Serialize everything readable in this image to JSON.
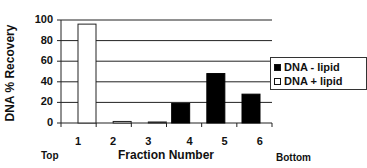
{
  "chart_data": {
    "type": "bar",
    "title": "",
    "xlabel": "Fraction Number",
    "ylabel": "DNA % Recovery",
    "ylim": [
      0,
      100
    ],
    "yticks": [
      0,
      20,
      40,
      60,
      80,
      100
    ],
    "grid": "horizontal",
    "categories": [
      "1",
      "2",
      "3",
      "4",
      "5",
      "6"
    ],
    "series": [
      {
        "name": "DNA - lipid",
        "color": "#000000",
        "values": [
          0,
          0,
          0,
          19,
          48,
          28
        ]
      },
      {
        "name": "DNA + lipid",
        "color": "#ffffff",
        "values": [
          96,
          1.5,
          1,
          0,
          0,
          0
        ]
      }
    ],
    "legend_position": "right",
    "annotations": {
      "left": "Top",
      "right": "Bottom"
    }
  },
  "labels": {
    "ylabel": "DNA % Recovery",
    "xlabel": "Fraction Number",
    "top": "Top",
    "bottom": "Bottom",
    "legend": [
      "DNA - lipid",
      "DNA + lipid"
    ],
    "yticks": [
      "0",
      "20",
      "40",
      "60",
      "80",
      "100"
    ],
    "categories": [
      "1",
      "2",
      "3",
      "4",
      "5",
      "6"
    ]
  }
}
